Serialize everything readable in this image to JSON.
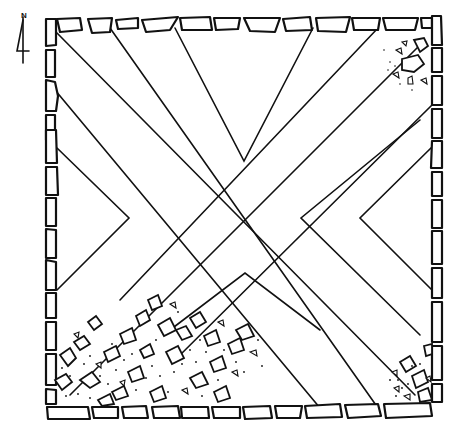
{
  "figure": {
    "type": "archaeological site plan"
  },
  "north_arrow": {
    "label": "N",
    "icon": "north-arrow-icon"
  },
  "colors": {
    "ink": "#111111",
    "background": "#ffffff"
  },
  "enclosure": {
    "bounds": {
      "left": 44,
      "top": 18,
      "right": 440,
      "bottom": 412
    },
    "center": [
      245,
      217
    ]
  },
  "chevrons": {
    "top_apex": [
      244,
      161
    ],
    "bottom_apex": [
      245,
      273
    ],
    "left_outer_apex": [
      129,
      218
    ],
    "left_inner_apex": [
      99,
      218
    ],
    "right_outer_apex": [
      301,
      218
    ],
    "right_inner_apex": [
      360,
      218
    ]
  },
  "rubble_areas": [
    {
      "name": "northeast-corner-rubble"
    },
    {
      "name": "southwest-rubble-spread"
    },
    {
      "name": "southeast-corner-rubble"
    }
  ]
}
